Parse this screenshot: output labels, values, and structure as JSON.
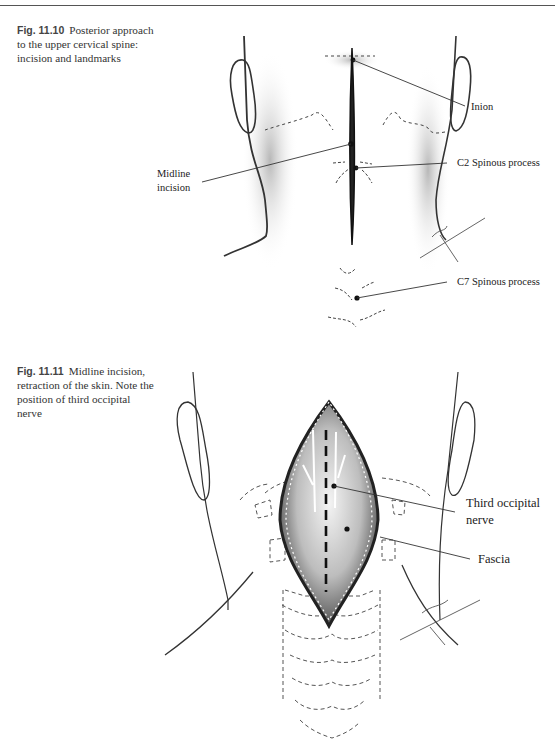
{
  "figures": [
    {
      "number": "Fig. 11.10",
      "caption": "Posterior approach to the upper cervical spine: incision and landmarks",
      "labels": {
        "inion": "Inion",
        "midline_incision_1": "Midline",
        "midline_incision_2": "incision",
        "c2": "C2 Spinous process",
        "c7": "C7 Spinous process"
      }
    },
    {
      "number": "Fig. 11.11",
      "caption": "Midline incision, retraction of the skin. Note the position of third occipital nerve",
      "labels": {
        "third_occipital_1": "Third occipital",
        "third_occipital_2": "nerve",
        "fascia": "Fascia"
      }
    }
  ]
}
